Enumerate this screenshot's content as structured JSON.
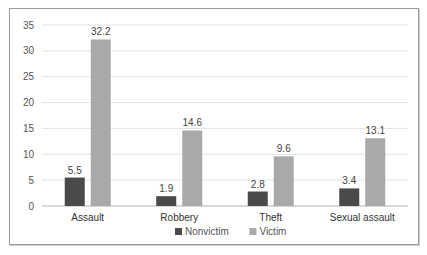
{
  "chart_data": {
    "type": "bar",
    "title": "",
    "xlabel": "",
    "ylabel": "",
    "categories": [
      "Assault",
      "Robbery",
      "Theft",
      "Sexual assault"
    ],
    "series": [
      {
        "name": "Nonvictim",
        "color": "#4a4a4a",
        "values": [
          5.5,
          1.9,
          2.8,
          3.4
        ]
      },
      {
        "name": "Victim",
        "color": "#a9a9a9",
        "values": [
          32.2,
          14.6,
          9.6,
          13.1
        ]
      }
    ],
    "ylim": [
      0,
      35
    ],
    "yticks": [
      0,
      5,
      10,
      15,
      20,
      25,
      30,
      35
    ],
    "grid": true,
    "legend_position": "bottom",
    "data_labels": true
  }
}
